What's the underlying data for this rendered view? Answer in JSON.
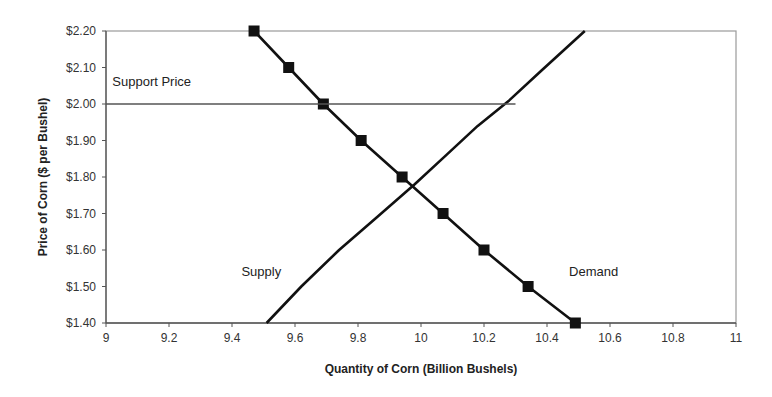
{
  "chart_data": {
    "type": "line",
    "title": "",
    "xlabel": "Quantity of Corn (Billion Bushels)",
    "ylabel": "Price of Corn ($ per Bushel)",
    "xlim": [
      9,
      11
    ],
    "ylim": [
      1.4,
      2.2
    ],
    "grid": false,
    "legend": "none",
    "x_ticks": [
      "9",
      "9.2",
      "9.4",
      "9.6",
      "9.8",
      "10",
      "10.2",
      "10.4",
      "10.6",
      "10.8",
      "11"
    ],
    "x_tick_values": [
      9,
      9.2,
      9.4,
      9.6,
      9.8,
      10,
      10.2,
      10.4,
      10.6,
      10.8,
      11
    ],
    "y_ticks": [
      "$1.40",
      "$1.50",
      "$1.60",
      "$1.70",
      "$1.80",
      "$1.90",
      "$2.00",
      "$2.10",
      "$2.20"
    ],
    "y_tick_values": [
      1.4,
      1.5,
      1.6,
      1.7,
      1.8,
      1.9,
      2.0,
      2.1,
      2.2
    ],
    "series": [
      {
        "name": "Demand",
        "marker": "square",
        "color": "#111111",
        "x": [
          9.47,
          9.58,
          9.69,
          9.81,
          9.94,
          10.07,
          10.2,
          10.34,
          10.49
        ],
        "y": [
          2.2,
          2.1,
          2.0,
          1.9,
          1.8,
          1.7,
          1.6,
          1.5,
          1.4
        ]
      },
      {
        "name": "Supply",
        "marker": "none",
        "color": "#111111",
        "x": [
          9.51,
          9.62,
          9.74,
          9.86,
          9.98,
          10.08,
          10.18,
          10.28,
          10.38,
          10.52
        ],
        "y": [
          1.4,
          1.5,
          1.6,
          1.69,
          1.78,
          1.86,
          1.94,
          2.01,
          2.09,
          2.2
        ]
      },
      {
        "name": "Support Price",
        "marker": "none",
        "color": "#555555",
        "x": [
          9,
          10.3
        ],
        "y": [
          2.0,
          2.0
        ]
      }
    ],
    "annotations": [
      {
        "text": "Support Price",
        "x": 9.02,
        "y": 2.05
      },
      {
        "text": "Supply",
        "x": 9.43,
        "y": 1.53
      },
      {
        "text": "Demand",
        "x": 10.47,
        "y": 1.53
      }
    ]
  }
}
